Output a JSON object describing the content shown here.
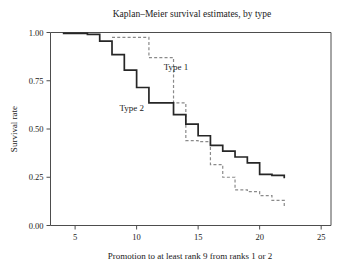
{
  "chart_data": {
    "type": "line",
    "title": "Kaplan–Meier survival estimates, by type",
    "xlabel": "Promotion to at least rank 9 from ranks 1 or 2",
    "ylabel": "Survival rate",
    "xlim": [
      3.0,
      25.8
    ],
    "ylim": [
      0.0,
      1.0
    ],
    "xticks": [
      5,
      10,
      15,
      20,
      25
    ],
    "xticklabels": [
      "5",
      "10",
      "15",
      "20",
      "25"
    ],
    "yticks": [
      0.0,
      0.25,
      0.5,
      0.75,
      1.0
    ],
    "yticklabels": [
      "0.00",
      "0.25",
      "0.50",
      "0.75",
      "1.00"
    ],
    "grid": false,
    "legend_position": "inline-annotation",
    "step_style": "post",
    "series": [
      {
        "name": "Type 1",
        "style": "dashed",
        "color": "#8a8a8a",
        "annotation": "Type 1",
        "annotation_x": 13.2,
        "annotation_y": 0.805,
        "x": [
          8.0,
          10.0,
          11.0,
          12.0,
          13.0,
          14.0,
          15.0,
          16.0,
          17.0,
          18.0,
          19.0,
          20.0,
          21.0,
          22.0
        ],
        "y": [
          0.975,
          0.975,
          0.87,
          0.87,
          0.635,
          0.44,
          0.435,
          0.315,
          0.25,
          0.185,
          0.175,
          0.155,
          0.13,
          0.09
        ]
      },
      {
        "name": "Type 2",
        "style": "solid",
        "color": "#262626",
        "annotation": "Type 2",
        "annotation_x": 9.6,
        "annotation_y": 0.595,
        "x": [
          4.0,
          6.0,
          7.0,
          8.0,
          9.0,
          10.0,
          11.0,
          12.0,
          13.0,
          14.0,
          15.0,
          16.0,
          17.0,
          18.0,
          19.0,
          20.0,
          21.0,
          22.0
        ],
        "y": [
          0.995,
          0.99,
          0.955,
          0.885,
          0.805,
          0.715,
          0.635,
          0.635,
          0.575,
          0.525,
          0.465,
          0.415,
          0.385,
          0.355,
          0.325,
          0.265,
          0.26,
          0.245
        ]
      }
    ]
  },
  "figure": {
    "background_color": "#ffffff",
    "frame_color": "#4d4d4d"
  }
}
